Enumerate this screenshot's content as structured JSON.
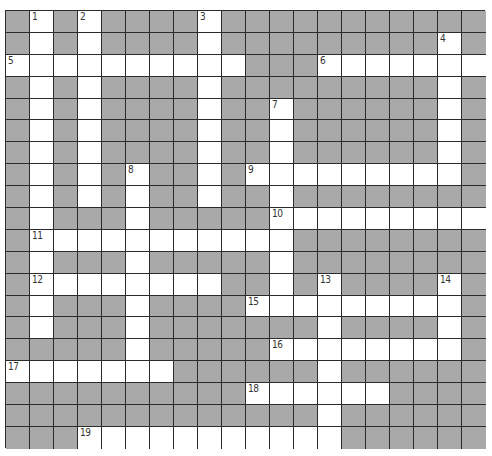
{
  "puzzle": {
    "rows": 20,
    "cols": 20,
    "colors": {
      "block": "#a9a9a9",
      "open": "#ffffff",
      "line": "#2b2b2b",
      "number": "#333333"
    },
    "across": [
      {
        "number": "5",
        "row": 2,
        "col": 0,
        "length": 10
      },
      {
        "number": "6",
        "row": 2,
        "col": 13,
        "length": 7
      },
      {
        "number": "9",
        "row": 7,
        "col": 10,
        "length": 9
      },
      {
        "number": "10",
        "row": 9,
        "col": 11,
        "length": 9
      },
      {
        "number": "11",
        "row": 10,
        "col": 1,
        "length": 11
      },
      {
        "number": "12",
        "row": 12,
        "col": 1,
        "length": 8
      },
      {
        "number": "15",
        "row": 13,
        "col": 10,
        "length": 9
      },
      {
        "number": "16",
        "row": 15,
        "col": 11,
        "length": 8
      },
      {
        "number": "17",
        "row": 16,
        "col": 0,
        "length": 7
      },
      {
        "number": "18",
        "row": 17,
        "col": 10,
        "length": 6
      },
      {
        "number": "19",
        "row": 19,
        "col": 3,
        "length": 11
      }
    ],
    "down": [
      {
        "number": "1",
        "row": 0,
        "col": 1,
        "length": 15
      },
      {
        "number": "2",
        "row": 0,
        "col": 3,
        "length": 9
      },
      {
        "number": "3",
        "row": 0,
        "col": 8,
        "length": 9
      },
      {
        "number": "4",
        "row": 1,
        "col": 18,
        "length": 7
      },
      {
        "number": "7",
        "row": 4,
        "col": 11,
        "length": 10
      },
      {
        "number": "8",
        "row": 7,
        "col": 5,
        "length": 10
      },
      {
        "number": "13",
        "row": 12,
        "col": 13,
        "length": 8
      },
      {
        "number": "14",
        "row": 12,
        "col": 18,
        "length": 4
      }
    ]
  }
}
